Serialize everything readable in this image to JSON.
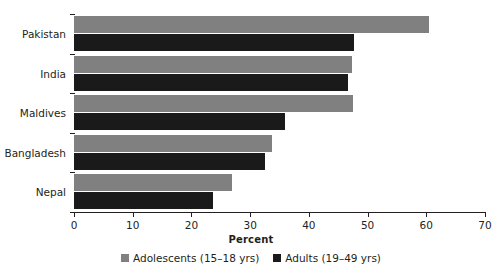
{
  "chart_data": {
    "type": "bar",
    "orientation": "horizontal",
    "title": "",
    "subtitle": "",
    "xlabel": "Percent",
    "ylabel": "",
    "xlim": [
      0,
      70
    ],
    "xticks": [
      0,
      10,
      20,
      30,
      40,
      50,
      60,
      70
    ],
    "grid": false,
    "legend_position": "bottom",
    "categories": [
      "Pakistan",
      "India",
      "Maldives",
      "Bangladesh",
      "Nepal"
    ],
    "series": [
      {
        "name": "Adolescents (15–18 yrs)",
        "color": "#808080",
        "values": [
          60.5,
          47.4,
          47.5,
          33.7,
          26.9
        ]
      },
      {
        "name": "Adults (19–49 yrs)",
        "color": "#1a1a1a",
        "values": [
          47.7,
          46.7,
          35.9,
          32.5,
          23.7
        ]
      }
    ],
    "annotations": []
  },
  "legend": {
    "items": [
      {
        "label": "Adolescents (15–18 yrs)",
        "color": "#808080"
      },
      {
        "label": "Adults (19–49 yrs)",
        "color": "#1a1a1a"
      }
    ]
  },
  "axis": {
    "x_title": "Percent",
    "tick_labels": [
      "0",
      "10",
      "20",
      "30",
      "40",
      "50",
      "60",
      "70"
    ]
  },
  "categories": {
    "labels": [
      "Pakistan",
      "India",
      "Maldives",
      "Bangladesh",
      "Nepal"
    ]
  },
  "colors": {
    "adolescents": "#808080",
    "adults": "#1a1a1a",
    "axis": "#231f20",
    "background": "#ffffff"
  }
}
